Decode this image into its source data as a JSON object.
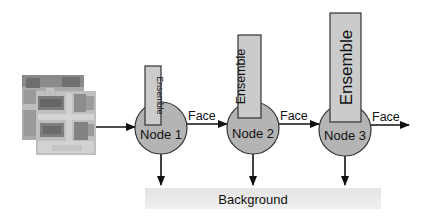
{
  "diagram": {
    "type": "cascade-classifier-flow",
    "input": {
      "label": "",
      "description": "stacked grayscale image patches"
    },
    "nodes": [
      {
        "id": "node1",
        "label": "Node 1",
        "ensemble_label": "Ensemble",
        "ensemble_size": "small"
      },
      {
        "id": "node2",
        "label": "Node 2",
        "ensemble_label": "Ensemble",
        "ensemble_size": "medium"
      },
      {
        "id": "node3",
        "label": "Node 3",
        "ensemble_label": "Ensemble",
        "ensemble_size": "large"
      }
    ],
    "edges": [
      {
        "from": "input",
        "to": "node1",
        "label": ""
      },
      {
        "from": "node1",
        "to": "node2",
        "label": "Face"
      },
      {
        "from": "node2",
        "to": "node3",
        "label": "Face"
      },
      {
        "from": "node3",
        "to": "output",
        "label": "Face"
      },
      {
        "from": "node1",
        "to": "background",
        "label": ""
      },
      {
        "from": "node2",
        "to": "background",
        "label": ""
      },
      {
        "from": "node3",
        "to": "background",
        "label": ""
      }
    ],
    "background_label": "Background",
    "colors": {
      "node_fill": "#b4b4b4",
      "ensemble_fill": "#c8c8c8",
      "background_bar": "#ececec",
      "stroke": "#333333"
    }
  }
}
